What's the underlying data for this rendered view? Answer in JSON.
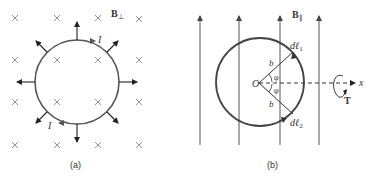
{
  "figure": {
    "panel_a": {
      "caption": "(a)",
      "field_label": "B",
      "field_subscript": "⊥",
      "current_label_top": "I",
      "current_label_bottom": "I",
      "field_marker": "×",
      "description": "Circular current loop in a perpendicular magnetic field (into page); radial outward force arrows"
    },
    "panel_b": {
      "caption": "(b)",
      "field_label": "B",
      "field_subscript": "∥",
      "origin_label": "O",
      "radius_label_1": "b",
      "radius_label_2": "b",
      "angle_label_1": "φ",
      "angle_label_2": "φ",
      "dl1_label": "dℓ",
      "dl1_sub": "1",
      "dl2_label": "dℓ",
      "dl2_sub": "2",
      "axis_label": "x",
      "torque_label": "T",
      "description": "Circular loop in a parallel magnetic field; torque about x-axis"
    },
    "colors": {
      "ink": "#333333",
      "loop": "#444444",
      "field_lines": "#555555",
      "cross": "#777777"
    }
  }
}
